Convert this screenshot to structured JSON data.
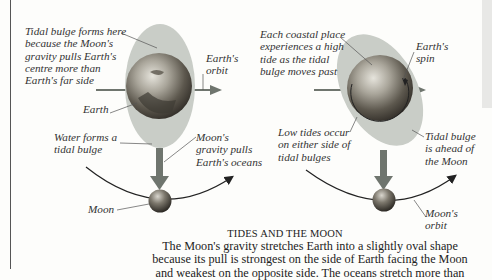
{
  "diagram": {
    "left_panel": {
      "labels": {
        "tidal_bulge_forms": "Tidal bulge forms here\nbecause the Moon's\ngravity pulls Earth's\ncentre more than\nEarth's far side",
        "earths_orbit": "Earth's\norbit",
        "earth": "Earth",
        "water_forms": "Water forms a\ntidal bulge",
        "moons_gravity": "Moon's\ngravity pulls\nEarth's oceans",
        "moon": "Moon"
      }
    },
    "right_panel": {
      "labels": {
        "each_coastal": "Each coastal place\nexperiences a high\ntide as the tidal\nbulge moves past",
        "earths_spin": "Earth's\nspin",
        "low_tides": "Low tides occur\non either side of\ntidal bulges",
        "bulge_ahead": "Tidal bulge\nis ahead of\nthe Moon",
        "moons_orbit": "Moon's\norbit"
      }
    },
    "colors": {
      "bulge": "#c9cdc7",
      "arrow": "#6f756e",
      "earth_dark": "#3e3a33",
      "earth_light": "#d8d6cc",
      "orbit_line": "#222222",
      "leader_line": "#555555"
    }
  },
  "caption": {
    "title": "TIDES AND THE MOON",
    "body": "The Moon's gravity stretches Earth into a slightly oval shape\nbecause its pull is strongest on the side of Earth facing the Moon\nand weakest on the opposite side. The oceans stretch more than"
  }
}
